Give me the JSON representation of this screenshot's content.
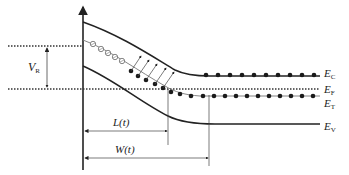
{
  "diagram": {
    "type": "band-diagram",
    "colors": {
      "line": "#222222",
      "dots": "#1a1a1a",
      "open_dots": "#888888",
      "background": "#ffffff"
    },
    "labels": {
      "vr": {
        "main": "V",
        "sub": "R"
      },
      "ec": {
        "main": "E",
        "sub": "C"
      },
      "ef": {
        "main": "E",
        "sub": "F"
      },
      "et": {
        "main": "E",
        "sub": "T"
      },
      "ev": {
        "main": "E",
        "sub": "V"
      },
      "lt": "L(t)",
      "wt": "W(t)"
    }
  }
}
